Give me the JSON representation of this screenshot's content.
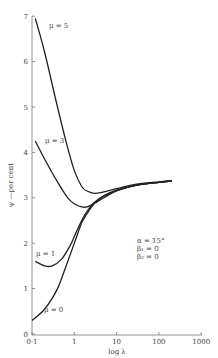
{
  "chart_data": {
    "type": "line",
    "title": "",
    "xlabel": "log λ",
    "ylabel": "ψ — per cent",
    "xscale": "log",
    "xlim": [
      0.1,
      1000
    ],
    "ylim": [
      0,
      7
    ],
    "xticks": [
      "0·1",
      "1",
      "10",
      "100",
      "1000"
    ],
    "yticks": [
      "0",
      "1",
      "2",
      "3",
      "4",
      "5",
      "6",
      "7"
    ],
    "grid": false,
    "annotations": [
      "α = 15°",
      "β₁ = 0",
      "β₂ = 0"
    ],
    "series": [
      {
        "name": "μ = 5",
        "x": [
          0.12,
          0.2,
          0.4,
          0.7,
          1,
          1.5,
          2,
          3,
          5,
          10,
          30,
          100,
          200
        ],
        "y": [
          6.95,
          6.2,
          5.0,
          4.1,
          3.6,
          3.25,
          3.15,
          3.1,
          3.13,
          3.2,
          3.3,
          3.35,
          3.37
        ]
      },
      {
        "name": "μ = 3",
        "x": [
          0.12,
          0.2,
          0.4,
          0.7,
          1,
          1.5,
          2,
          3,
          5,
          10,
          30,
          100,
          200
        ],
        "y": [
          4.25,
          3.85,
          3.35,
          3.0,
          2.87,
          2.8,
          2.8,
          2.88,
          3.0,
          3.15,
          3.28,
          3.34,
          3.37
        ]
      },
      {
        "name": "μ = 1",
        "x": [
          0.12,
          0.2,
          0.3,
          0.5,
          0.8,
          1,
          1.5,
          2,
          3,
          5,
          10,
          30,
          100,
          200
        ],
        "y": [
          1.6,
          1.5,
          1.5,
          1.65,
          1.95,
          2.15,
          2.5,
          2.7,
          2.9,
          3.05,
          3.17,
          3.28,
          3.34,
          3.37
        ]
      },
      {
        "name": "μ = 0",
        "x": [
          0.1,
          0.2,
          0.4,
          0.7,
          1,
          1.5,
          2,
          3,
          5,
          10,
          30,
          100,
          200
        ],
        "y": [
          0.3,
          0.55,
          1.0,
          1.6,
          2.0,
          2.45,
          2.65,
          2.88,
          3.03,
          3.16,
          3.28,
          3.34,
          3.37
        ]
      }
    ]
  },
  "labels": {
    "xlabel": "log λ",
    "ylabel": "ψ —per cent",
    "mu5": "μ = 5",
    "mu3": "μ = 3",
    "mu1": "μ = 1",
    "mu0": "μ = 0",
    "alpha": "α = 15°",
    "beta1": "β₁ = 0",
    "beta2": "β₂ = 0",
    "xticks": [
      "0·1",
      "1",
      "10",
      "100",
      "1000"
    ],
    "yticks": [
      "0",
      "1",
      "2",
      "3",
      "4",
      "5",
      "6",
      "7"
    ]
  },
  "colors": {
    "line": "#222222",
    "axis": "#777777",
    "text": "#444444"
  }
}
